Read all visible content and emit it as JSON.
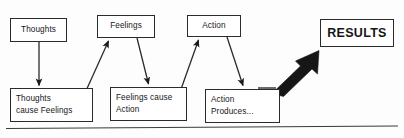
{
  "diagram": {
    "background_color": "#fdfdfd",
    "stroke_color": "#2b2b2b",
    "arrow_fill": "#1a1a1a",
    "boxes": [
      {
        "id": "thoughts",
        "label": "Thoughts"
      },
      {
        "id": "feelings",
        "label": "Feelings"
      },
      {
        "id": "action",
        "label": "Action"
      },
      {
        "id": "results",
        "label": "RESULTS"
      },
      {
        "id": "thoughts-cause",
        "line1": "Thoughts",
        "line2": "cause Feelings"
      },
      {
        "id": "feelings-cause",
        "line1": "Feelings cause",
        "line2": "Action"
      },
      {
        "id": "action-produces",
        "line1": "Action",
        "line2": "Produces..."
      }
    ],
    "connectors": [
      {
        "id": "thoughts-down",
        "from": "thoughts",
        "to": "thoughts-cause",
        "style": "thin-arrow"
      },
      {
        "id": "thoughts-cause-up",
        "from": "thoughts-cause",
        "to": "feelings",
        "style": "thin-arrow"
      },
      {
        "id": "feelings-down",
        "from": "feelings",
        "to": "feelings-cause",
        "style": "thin-arrow"
      },
      {
        "id": "feelings-cause-up",
        "from": "feelings-cause",
        "to": "action",
        "style": "thin-arrow"
      },
      {
        "id": "action-down",
        "from": "action",
        "to": "action-produces",
        "style": "thin-arrow"
      },
      {
        "id": "action-produces-up",
        "from": "action-produces",
        "to": "results",
        "style": "thick-block-arrow"
      }
    ],
    "baseline": {
      "id": "baseline-rule",
      "description": "horizontal rule across bottom"
    }
  }
}
